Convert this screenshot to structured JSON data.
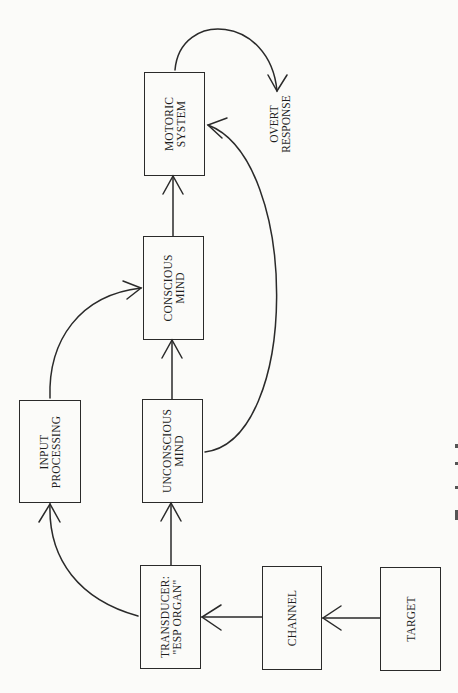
{
  "diagram": {
    "orientation": "rotated 90deg counter-clockwise (flow reads bottom-to-top)",
    "colors": {
      "background": "#fbfbf9",
      "ink": "#2a2a2a"
    },
    "nodes": {
      "target": {
        "line1": "TARGET",
        "line2": ""
      },
      "channel": {
        "line1": "CHANNEL",
        "line2": ""
      },
      "transducer": {
        "line1": "TRANSDUCER:",
        "line2": "\"ESP ORGAN\""
      },
      "input_processing": {
        "line1": "INPUT",
        "line2": "PROCESSING"
      },
      "unconscious": {
        "line1": "UNCONSCIOUS",
        "line2": "MIND"
      },
      "conscious": {
        "line1": "CONSCIOUS",
        "line2": "MIND"
      },
      "motoric": {
        "line1": "MOTORIC",
        "line2": "SYSTEM"
      }
    },
    "output_label": {
      "line1": "OVERT",
      "line2": "RESPONSE"
    },
    "edges": [
      {
        "from": "TARGET",
        "to": "CHANNEL",
        "style": "straight"
      },
      {
        "from": "CHANNEL",
        "to": "TRANSDUCER: \"ESP ORGAN\"",
        "style": "straight"
      },
      {
        "from": "TRANSDUCER: \"ESP ORGAN\"",
        "to": "UNCONSCIOUS MIND",
        "style": "straight"
      },
      {
        "from": "TRANSDUCER: \"ESP ORGAN\"",
        "to": "INPUT PROCESSING",
        "style": "curved"
      },
      {
        "from": "UNCONSCIOUS MIND",
        "to": "CONSCIOUS MIND",
        "style": "straight"
      },
      {
        "from": "INPUT PROCESSING",
        "to": "CONSCIOUS MIND",
        "style": "curved"
      },
      {
        "from": "CONSCIOUS MIND",
        "to": "MOTORIC SYSTEM",
        "style": "straight"
      },
      {
        "from": "UNCONSCIOUS MIND",
        "to": "MOTORIC SYSTEM",
        "style": "curved"
      },
      {
        "from": "MOTORIC SYSTEM",
        "to": "OVERT RESPONSE",
        "style": "curved"
      }
    ]
  }
}
